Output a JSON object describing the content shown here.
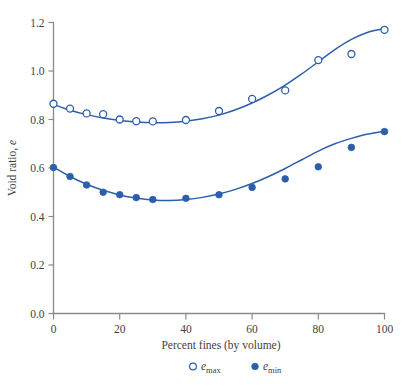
{
  "chart_data": {
    "type": "scatter",
    "title": "",
    "subtitle": "",
    "xlabel": "Percent fines (by volume)",
    "ylabel": "Void ratio, e",
    "ylabel_parts": {
      "text": "Void ratio, ",
      "italic": "e"
    },
    "xlim": [
      0,
      100
    ],
    "ylim": [
      0.0,
      1.2
    ],
    "xticks": [
      0,
      20,
      40,
      60,
      80,
      100
    ],
    "xtick_labels": [
      "0",
      "20",
      "40",
      "60",
      "80",
      "100"
    ],
    "yticks": [
      0.0,
      0.2,
      0.4,
      0.6,
      0.8,
      1.0,
      1.2
    ],
    "ytick_labels": [
      "0.0",
      "0.2",
      "0.4",
      "0.6",
      "0.8",
      "1.0",
      "1.2"
    ],
    "grid": false,
    "legend_position": "below",
    "accent_color": "#2b5faa",
    "axis_color": "#8a8a8a",
    "series": [
      {
        "name": "e_max",
        "legend_label": "e",
        "legend_subscript": "max",
        "marker": "open-circle",
        "color": "#2b5faa",
        "x": [
          0,
          5,
          10,
          15,
          20,
          25,
          30,
          40,
          50,
          60,
          70,
          80,
          90,
          100
        ],
        "y": [
          0.865,
          0.845,
          0.825,
          0.822,
          0.8,
          0.793,
          0.792,
          0.798,
          0.835,
          0.885,
          0.92,
          1.045,
          1.07,
          1.17
        ],
        "fit_x": [
          0,
          5,
          10,
          15,
          20,
          25,
          30,
          35,
          40,
          45,
          50,
          55,
          60,
          65,
          70,
          75,
          80,
          85,
          90,
          95,
          100
        ],
        "fit_y": [
          0.862,
          0.838,
          0.82,
          0.806,
          0.796,
          0.79,
          0.787,
          0.788,
          0.793,
          0.803,
          0.818,
          0.84,
          0.868,
          0.902,
          0.942,
          0.988,
          1.038,
          1.088,
          1.13,
          1.16,
          1.175
        ]
      },
      {
        "name": "e_min",
        "legend_label": "e",
        "legend_subscript": "min",
        "marker": "filled-circle",
        "color": "#2b5faa",
        "x": [
          0,
          5,
          10,
          15,
          20,
          25,
          30,
          40,
          50,
          60,
          70,
          80,
          90,
          100
        ],
        "y": [
          0.602,
          0.565,
          0.53,
          0.5,
          0.49,
          0.478,
          0.47,
          0.475,
          0.49,
          0.52,
          0.555,
          0.605,
          0.685,
          0.75
        ],
        "fit_x": [
          0,
          5,
          10,
          15,
          20,
          25,
          30,
          35,
          40,
          45,
          50,
          55,
          60,
          65,
          70,
          75,
          80,
          85,
          90,
          95,
          100
        ],
        "fit_y": [
          0.604,
          0.565,
          0.533,
          0.508,
          0.489,
          0.476,
          0.468,
          0.466,
          0.47,
          0.479,
          0.493,
          0.512,
          0.536,
          0.565,
          0.598,
          0.634,
          0.67,
          0.7,
          0.722,
          0.74,
          0.752
        ]
      }
    ]
  },
  "legend": {
    "items": [
      {
        "symbol": "open-circle",
        "label": "e",
        "subscript": "max"
      },
      {
        "symbol": "filled-circle",
        "label": "e",
        "subscript": "min"
      }
    ]
  }
}
